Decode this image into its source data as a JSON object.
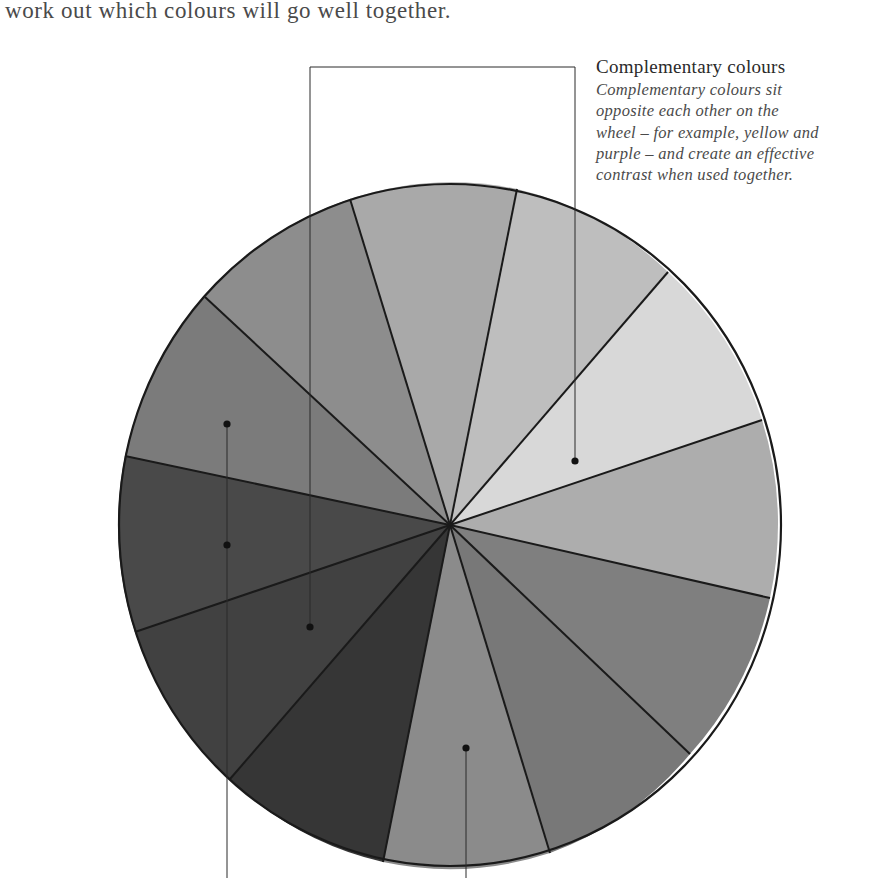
{
  "intro": {
    "text": "work out which colours will go well together."
  },
  "annotation": {
    "title": "Complementary colours",
    "body_lines": [
      "Complementary colours sit",
      "opposite each other on the",
      "wheel – for example, yellow and",
      "purple – and create an effective",
      "contrast when used together."
    ]
  },
  "wheel": {
    "center": [
      450,
      525
    ],
    "rx": 331,
    "ry": 341,
    "outline_color": "#1a1a1a",
    "segment_count": 12,
    "boundary_points": [
      [
        517,
        189
      ],
      [
        668,
        272
      ],
      [
        762,
        420
      ],
      [
        770,
        598
      ],
      [
        690,
        754
      ],
      [
        550,
        853
      ],
      [
        383,
        862
      ],
      [
        230,
        779
      ],
      [
        135,
        632
      ],
      [
        125,
        456
      ],
      [
        205,
        297
      ],
      [
        350,
        199
      ]
    ],
    "segments": [
      {
        "from": 11,
        "to": 0,
        "fill": "#a9a9a9"
      },
      {
        "from": 0,
        "to": 1,
        "fill": "#bebebe"
      },
      {
        "from": 1,
        "to": 2,
        "fill": "#d8d8d8"
      },
      {
        "from": 2,
        "to": 3,
        "fill": "#adadad"
      },
      {
        "from": 3,
        "to": 4,
        "fill": "#7f7f7f"
      },
      {
        "from": 4,
        "to": 5,
        "fill": "#787878"
      },
      {
        "from": 5,
        "to": 6,
        "fill": "#8b8b8b"
      },
      {
        "from": 6,
        "to": 7,
        "fill": "#363636"
      },
      {
        "from": 7,
        "to": 8,
        "fill": "#414141"
      },
      {
        "from": 8,
        "to": 9,
        "fill": "#494949"
      },
      {
        "from": 9,
        "to": 10,
        "fill": "#7b7b7b"
      },
      {
        "from": 10,
        "to": 11,
        "fill": "#8d8d8d"
      }
    ]
  },
  "leaders": {
    "line_color": "#2a2a2a",
    "dot_color": "#111111",
    "complementary_bracket": {
      "points": [
        [
          310,
          627
        ],
        [
          310,
          67
        ],
        [
          575,
          67
        ],
        [
          575,
          461
        ]
      ],
      "dots": [
        [
          310,
          627
        ],
        [
          575,
          461
        ]
      ]
    },
    "left_vertical": {
      "points": [
        [
          227,
          424
        ],
        [
          227,
          878
        ]
      ],
      "dots": [
        [
          227,
          424
        ],
        [
          227,
          545
        ]
      ]
    },
    "bottom_vertical": {
      "points": [
        [
          466,
          748
        ],
        [
          466,
          878
        ]
      ],
      "dots": [
        [
          466,
          748
        ]
      ]
    }
  }
}
